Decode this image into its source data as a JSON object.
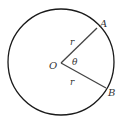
{
  "diagram": {
    "type": "circle-sector",
    "points": {
      "center": "O",
      "point_a": "A",
      "point_b": "B"
    },
    "radius_labels": [
      "r",
      "r"
    ],
    "angle_label": "θ",
    "colors": {
      "circle": "#1a1a1a",
      "radii": "#444444",
      "text": "#333333"
    }
  }
}
